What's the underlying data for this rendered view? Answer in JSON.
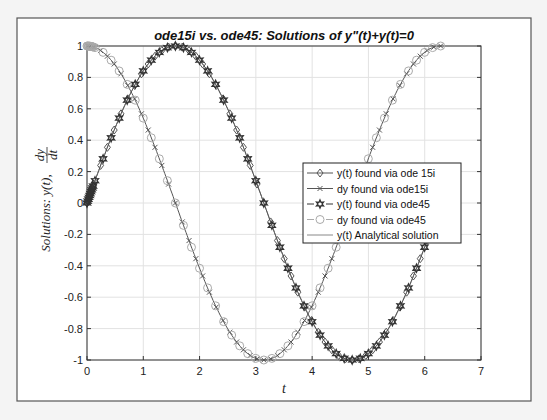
{
  "chart_data": {
    "type": "line",
    "title": "ode15i vs. ode45: Solutions of y\"(t)+y(t)=0",
    "xlabel": "t",
    "ylabel": "Solutions: y(t), dy/dt",
    "xlim": [
      0,
      7
    ],
    "ylim": [
      -1,
      1
    ],
    "xticks": [
      "0",
      "1",
      "2",
      "3",
      "4",
      "5",
      "6",
      "7"
    ],
    "yticks": [
      "1",
      "0.8",
      "0.6",
      "0.4",
      "0.2",
      "0",
      "-0.2",
      "-0.4",
      "-0.6",
      "-0.8",
      "-1"
    ],
    "grid": true,
    "legend_position": "east",
    "x_range_data": [
      0,
      6.2832
    ],
    "series": [
      {
        "name": "y(t) found via ode 15i",
        "function": "sin(t)",
        "marker": "diamond",
        "line": "solid",
        "color": "#555555"
      },
      {
        "name": "dy found via ode15i",
        "function": "cos(t)",
        "marker": "x",
        "line": "solid",
        "color": "#555555"
      },
      {
        "name": "y(t) found via ode45",
        "function": "sin(t)",
        "marker": "hexagram",
        "line": "dashed",
        "color": "#333333"
      },
      {
        "name": "dy found via ode45",
        "function": "cos(t)",
        "marker": "circle",
        "line": "dashed",
        "color": "#aaaaaa"
      },
      {
        "name": "y(t) Analytical solution",
        "function": "sin(t)",
        "marker": "none",
        "line": "solid",
        "color": "#888888"
      }
    ],
    "sample_points": {
      "t": [
        0,
        0.5,
        1.0,
        1.5708,
        2.0,
        2.5,
        3.1416,
        3.5,
        4.0,
        4.7124,
        5.0,
        5.5,
        6.2832
      ],
      "sin": [
        0,
        0.479,
        0.841,
        1.0,
        0.909,
        0.598,
        0.0,
        -0.351,
        -0.757,
        -1.0,
        -0.959,
        -0.706,
        0.0
      ],
      "cos": [
        1.0,
        0.878,
        0.54,
        0.0,
        -0.416,
        -0.801,
        -1.0,
        -0.936,
        -0.654,
        0.0,
        0.284,
        0.709,
        1.0
      ]
    }
  },
  "labels": {
    "title": "ode15i vs. ode45: Solutions of y\"(t)+y(t)=0",
    "xlabel": "t",
    "ylabel_prefix": "Solutions: y(t),",
    "ylabel_num": "dy",
    "ylabel_den": "dt"
  }
}
